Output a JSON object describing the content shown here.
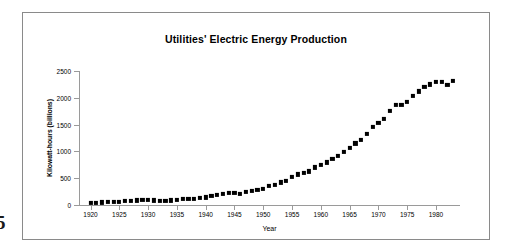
{
  "page": {
    "page_number": "5"
  },
  "figure": {
    "title": "Utilities' Electric Energy Production"
  },
  "chart_data": {
    "type": "scatter",
    "title": "Utilities' Electric Energy Production",
    "xlabel": "Year",
    "ylabel": "Kilowatt-hours (billions)",
    "xlim": [
      1918,
      1984
    ],
    "ylim": [
      0,
      2500
    ],
    "grid": false,
    "legend": false,
    "marker": "filled-square",
    "marker_color": "#000000",
    "xticks": [
      1920,
      1925,
      1930,
      1935,
      1940,
      1945,
      1950,
      1955,
      1960,
      1965,
      1970,
      1975,
      1980
    ],
    "xtick_labels": [
      "1920",
      "1925",
      "1930",
      "1935",
      "1940",
      "1945",
      "1950",
      "1955",
      "1960",
      "1965",
      "1970",
      "1975",
      "1980"
    ],
    "yticks": [
      0,
      500,
      1000,
      1500,
      2000,
      2500
    ],
    "ytick_labels": [
      "0",
      "500",
      "1000",
      "1500",
      "2000",
      "2500"
    ],
    "x": [
      1920,
      1921,
      1922,
      1923,
      1924,
      1925,
      1926,
      1927,
      1928,
      1929,
      1930,
      1931,
      1932,
      1933,
      1934,
      1935,
      1936,
      1937,
      1938,
      1939,
      1940,
      1941,
      1942,
      1943,
      1944,
      1945,
      1946,
      1947,
      1948,
      1949,
      1950,
      1951,
      1952,
      1953,
      1954,
      1955,
      1956,
      1957,
      1958,
      1959,
      1960,
      1961,
      1962,
      1963,
      1964,
      1965,
      1966,
      1967,
      1968,
      1969,
      1970,
      1971,
      1972,
      1973,
      1974,
      1975,
      1976,
      1977,
      1978,
      1979,
      1980,
      1981,
      1982,
      1983
    ],
    "values": [
      40,
      41,
      47,
      55,
      59,
      65,
      72,
      78,
      85,
      95,
      92,
      87,
      78,
      80,
      85,
      92,
      107,
      116,
      112,
      125,
      142,
      164,
      184,
      212,
      225,
      222,
      213,
      237,
      263,
      278,
      305,
      350,
      381,
      422,
      446,
      520,
      570,
      606,
      628,
      702,
      755,
      795,
      855,
      920,
      990,
      1060,
      1150,
      1210,
      1330,
      1450,
      1530,
      1610,
      1750,
      1860,
      1860,
      1920,
      2040,
      2120,
      2210,
      2250,
      2290,
      2290,
      2240,
      2310
    ],
    "series_note": "Annual U.S. electric utility energy production, billions of kilowatt-hours"
  }
}
